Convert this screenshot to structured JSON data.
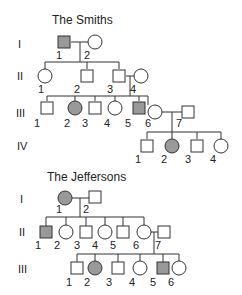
{
  "colors": {
    "affected": "#999999",
    "unaffected": "#ffffff",
    "stroke": "#333333"
  },
  "pedigrees": [
    {
      "title": "The Smiths",
      "title_pos": [
        52,
        24
      ],
      "generations": [
        {
          "label": "I",
          "x": 18,
          "y": 48
        },
        {
          "label": "II",
          "x": 17,
          "y": 80
        },
        {
          "label": "III",
          "x": 16,
          "y": 117
        },
        {
          "label": "IV",
          "x": 17,
          "y": 150
        }
      ],
      "individuals": [
        {
          "id": "I-1",
          "num": "1",
          "sex": "male",
          "affected": true,
          "x": 64,
          "y": 42,
          "lx": 56,
          "ly": 59
        },
        {
          "id": "I-2",
          "num": "2",
          "sex": "female",
          "affected": false,
          "x": 95,
          "y": 42,
          "lx": 84,
          "ly": 59
        },
        {
          "id": "II-1",
          "num": "1",
          "sex": "female",
          "affected": false,
          "x": 45,
          "y": 76,
          "lx": 38,
          "ly": 93
        },
        {
          "id": "II-2",
          "num": "2",
          "sex": "male",
          "affected": false,
          "x": 87,
          "y": 76,
          "lx": 74,
          "ly": 93
        },
        {
          "id": "II-3",
          "num": "3",
          "sex": "male",
          "affected": false,
          "x": 119,
          "y": 76,
          "lx": 107,
          "ly": 93
        },
        {
          "id": "II-4",
          "num": "4",
          "sex": "female",
          "affected": false,
          "x": 141,
          "y": 76,
          "lx": 130,
          "ly": 93
        },
        {
          "id": "III-1",
          "num": "1",
          "sex": "male",
          "affected": false,
          "x": 47,
          "y": 108,
          "lx": 34,
          "ly": 127
        },
        {
          "id": "III-2",
          "num": "2",
          "sex": "female",
          "affected": true,
          "x": 75,
          "y": 108,
          "lx": 64,
          "ly": 127
        },
        {
          "id": "III-3",
          "num": "3",
          "sex": "male",
          "affected": false,
          "x": 95,
          "y": 108,
          "lx": 82,
          "ly": 127
        },
        {
          "id": "III-4",
          "num": "4",
          "sex": "female",
          "affected": false,
          "x": 115,
          "y": 108,
          "lx": 104,
          "ly": 127
        },
        {
          "id": "III-5",
          "num": "5",
          "sex": "male",
          "affected": true,
          "x": 139,
          "y": 108,
          "lx": 125,
          "ly": 127
        },
        {
          "id": "III-6",
          "num": "6",
          "sex": "female",
          "affected": false,
          "x": 155,
          "y": 112,
          "lx": 145,
          "ly": 127
        },
        {
          "id": "III-7",
          "num": "7",
          "sex": "male",
          "affected": false,
          "x": 188,
          "y": 112,
          "lx": 176,
          "ly": 127
        },
        {
          "id": "IV-1",
          "num": "1",
          "sex": "male",
          "affected": false,
          "x": 147,
          "y": 146,
          "lx": 135,
          "ly": 163
        },
        {
          "id": "IV-2",
          "num": "2",
          "sex": "female",
          "affected": true,
          "x": 172,
          "y": 146,
          "lx": 161,
          "ly": 163
        },
        {
          "id": "IV-3",
          "num": "3",
          "sex": "male",
          "affected": false,
          "x": 197,
          "y": 146,
          "lx": 185,
          "ly": 163
        },
        {
          "id": "IV-4",
          "num": "4",
          "sex": "female",
          "affected": false,
          "x": 221,
          "y": 146,
          "lx": 210,
          "ly": 163
        }
      ],
      "lines": [
        [
          71,
          42,
          88,
          42
        ],
        [
          80,
          42,
          80,
          62
        ],
        [
          45,
          62,
          119,
          62
        ],
        [
          45,
          62,
          45,
          69
        ],
        [
          87,
          62,
          87,
          69
        ],
        [
          119,
          62,
          119,
          69
        ],
        [
          126,
          76,
          134,
          76
        ],
        [
          130,
          76,
          130,
          96
        ],
        [
          47,
          96,
          148,
          96
        ],
        [
          47,
          96,
          47,
          101
        ],
        [
          75,
          96,
          75,
          101
        ],
        [
          95,
          96,
          95,
          101
        ],
        [
          115,
          96,
          115,
          101
        ],
        [
          139,
          96,
          139,
          101
        ],
        [
          148,
          96,
          148,
          105
        ],
        [
          162,
          112,
          182,
          112
        ],
        [
          172,
          112,
          172,
          132
        ],
        [
          147,
          132,
          221,
          132
        ],
        [
          147,
          132,
          147,
          139
        ],
        [
          172,
          132,
          172,
          139
        ],
        [
          197,
          132,
          197,
          139
        ],
        [
          221,
          132,
          221,
          139
        ]
      ]
    },
    {
      "title": "The Jeffersons",
      "title_pos": [
        47,
        181
      ],
      "generations": [
        {
          "label": "I",
          "x": 20,
          "y": 203
        },
        {
          "label": "II",
          "x": 19,
          "y": 236
        },
        {
          "label": "III",
          "x": 18,
          "y": 273
        }
      ],
      "individuals": [
        {
          "id": "I-1",
          "num": "1",
          "sex": "female",
          "affected": true,
          "x": 65,
          "y": 198,
          "lx": 56,
          "ly": 213
        },
        {
          "id": "I-2",
          "num": "2",
          "sex": "male",
          "affected": false,
          "x": 95,
          "y": 197,
          "lx": 83,
          "ly": 213
        },
        {
          "id": "II-1",
          "num": "1",
          "sex": "male",
          "affected": true,
          "x": 46,
          "y": 232,
          "lx": 35,
          "ly": 249
        },
        {
          "id": "II-2",
          "num": "2",
          "sex": "female",
          "affected": false,
          "x": 66,
          "y": 232,
          "lx": 54,
          "ly": 249
        },
        {
          "id": "II-3",
          "num": "3",
          "sex": "male",
          "affected": false,
          "x": 86,
          "y": 232,
          "lx": 74,
          "ly": 249
        },
        {
          "id": "II-4",
          "num": "4",
          "sex": "female",
          "affected": false,
          "x": 105,
          "y": 232,
          "lx": 92,
          "ly": 249
        },
        {
          "id": "II-5",
          "num": "5",
          "sex": "male",
          "affected": false,
          "x": 123,
          "y": 232,
          "lx": 110,
          "ly": 249
        },
        {
          "id": "II-6",
          "num": "6",
          "sex": "female",
          "affected": false,
          "x": 144,
          "y": 232,
          "lx": 133,
          "ly": 249
        },
        {
          "id": "II-7",
          "num": "7",
          "sex": "male",
          "affected": false,
          "x": 164,
          "y": 232,
          "lx": 155,
          "ly": 249
        },
        {
          "id": "III-1",
          "num": "1",
          "sex": "male",
          "affected": false,
          "x": 77,
          "y": 268,
          "lx": 66,
          "ly": 286
        },
        {
          "id": "III-2",
          "num": "2",
          "sex": "female",
          "affected": true,
          "x": 95,
          "y": 268,
          "lx": 84,
          "ly": 286
        },
        {
          "id": "III-3",
          "num": "3",
          "sex": "male",
          "affected": false,
          "x": 118,
          "y": 268,
          "lx": 106,
          "ly": 286
        },
        {
          "id": "III-4",
          "num": "4",
          "sex": "female",
          "affected": false,
          "x": 140,
          "y": 268,
          "lx": 129,
          "ly": 286
        },
        {
          "id": "III-5",
          "num": "5",
          "sex": "male",
          "affected": true,
          "x": 163,
          "y": 268,
          "lx": 150,
          "ly": 286
        },
        {
          "id": "III-6",
          "num": "6",
          "sex": "female",
          "affected": false,
          "x": 179,
          "y": 268,
          "lx": 168,
          "ly": 286
        }
      ],
      "lines": [
        [
          72,
          198,
          89,
          198
        ],
        [
          80,
          198,
          80,
          217
        ],
        [
          46,
          217,
          144,
          217
        ],
        [
          46,
          217,
          46,
          226
        ],
        [
          66,
          217,
          66,
          225
        ],
        [
          86,
          217,
          86,
          226
        ],
        [
          105,
          217,
          105,
          225
        ],
        [
          123,
          217,
          123,
          226
        ],
        [
          144,
          217,
          144,
          225
        ],
        [
          151,
          232,
          158,
          232
        ],
        [
          154,
          232,
          154,
          254
        ],
        [
          77,
          254,
          179,
          254
        ],
        [
          77,
          254,
          77,
          262
        ],
        [
          95,
          254,
          95,
          261
        ],
        [
          118,
          254,
          118,
          262
        ],
        [
          140,
          254,
          140,
          261
        ],
        [
          163,
          254,
          163,
          262
        ],
        [
          179,
          254,
          179,
          261
        ]
      ]
    }
  ]
}
